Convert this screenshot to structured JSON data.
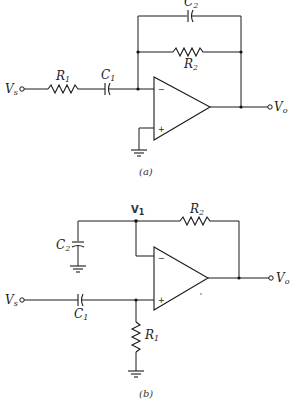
{
  "figure_a": {
    "caption": "(a)",
    "input_label": "V",
    "input_sub": "s",
    "output_label": "V",
    "output_sub": "o",
    "r1_label": "R",
    "r1_sub": "1",
    "c1_label": "C",
    "c1_sub": "1",
    "r2_label": "R",
    "r2_sub": "2",
    "c2_label": "C",
    "c2_sub": "2",
    "inv_sign": "−",
    "noninv_sign": "+"
  },
  "figure_b": {
    "caption": "(b)",
    "input_label": "V",
    "input_sub": "s",
    "output_label": "V",
    "output_sub": "o",
    "node_label": "V",
    "node_sub": "1",
    "r1_label": "R",
    "r1_sub": "1",
    "c1_label": "C",
    "c1_sub": "1",
    "r2_label": "R",
    "r2_sub": "2",
    "c2_label": "C",
    "c2_sub": "2",
    "inv_sign": "−",
    "noninv_sign": "+"
  },
  "colors": {
    "ink": "#1a1a1a",
    "background": "#ffffff"
  }
}
